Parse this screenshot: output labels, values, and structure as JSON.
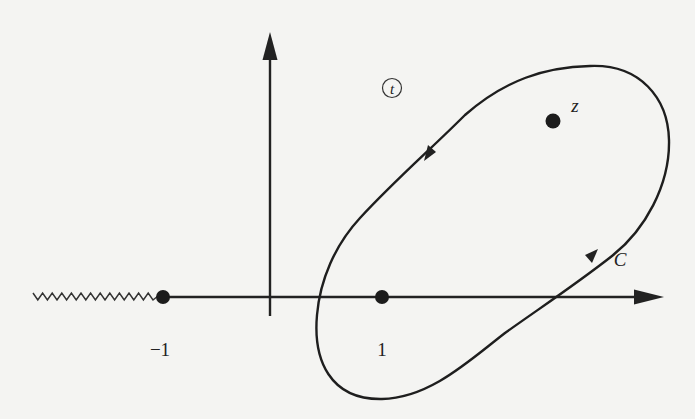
{
  "figure": {
    "plane_label": "t",
    "contour_label": "C",
    "points": [
      {
        "id": "minus-one",
        "label": "−1",
        "x": 163,
        "y": 297,
        "label_x": 160,
        "label_y": 350
      },
      {
        "id": "one",
        "label": "1",
        "x": 382,
        "y": 297,
        "label_x": 382,
        "label_y": 350
      },
      {
        "id": "z",
        "label": "z",
        "x": 553,
        "y": 121,
        "label_x": 576,
        "label_y": 112
      }
    ],
    "branch_cut": {
      "from_x": 33,
      "to_x": 158,
      "y": 297,
      "description": "zigzag branch cut from −∞ to −1"
    },
    "axes": {
      "real": {
        "x1": 160,
        "x2": 663,
        "y": 297
      },
      "imaginary": {
        "x": 270,
        "y1": 315,
        "y2": 33
      }
    },
    "contour": {
      "orientation": "counterclockwise",
      "encloses": [
        "1",
        "z"
      ],
      "excludes": [
        "−1"
      ]
    },
    "colors": {
      "ink": "#222222",
      "paper": "#f4f4f2"
    }
  }
}
